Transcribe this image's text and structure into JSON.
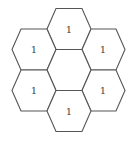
{
  "diagram": {
    "title": "",
    "stroke_color": "#555555",
    "cells": [
      {
        "id": "top",
        "label": "1"
      },
      {
        "id": "upper-left",
        "label": "1"
      },
      {
        "id": "upper-right",
        "label": "1"
      },
      {
        "id": "center",
        "label": ""
      },
      {
        "id": "lower-left",
        "label": "1"
      },
      {
        "id": "lower-right",
        "label": "1"
      },
      {
        "id": "bottom",
        "label": "1"
      }
    ]
  }
}
